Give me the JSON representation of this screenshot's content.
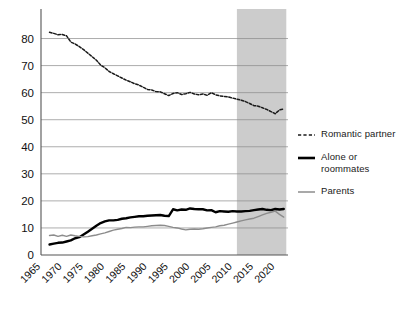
{
  "chart_data": {
    "type": "line",
    "title": "",
    "subtitle": "",
    "xlabel": "",
    "ylabel": "",
    "xlim": [
      1965,
      1922.5
    ],
    "x_range": [
      1965,
      2023
    ],
    "ylim": [
      0,
      85
    ],
    "yticks": [
      0,
      10,
      20,
      30,
      40,
      50,
      60,
      70,
      80
    ],
    "ytick_labels": [
      "0",
      "10",
      "20",
      "30",
      "40",
      "50",
      "60",
      "70",
      "80"
    ],
    "xticks": [
      1965,
      1970,
      1975,
      1980,
      1985,
      1990,
      1995,
      2000,
      2005,
      2010,
      2015,
      2020
    ],
    "xtick_labels": [
      "1965",
      "1970",
      "1975",
      "1980",
      "1985",
      "1990",
      "1995",
      "2000",
      "2005",
      "2010",
      "2015",
      "2020"
    ],
    "xtick_rotation": -45,
    "grid": "horizontal",
    "legend_position": "right",
    "shaded_region": {
      "x0": 2011,
      "x1": 2022.6,
      "color": "#cccccc",
      "label": ""
    },
    "colors": {
      "romantic_partner": "#1a1a1a",
      "alone_or_roommates": "#000000",
      "parents": "#8c8c8c"
    },
    "series": [
      {
        "name": "Romantic partner",
        "style": "dashed",
        "color": "#1a1a1a",
        "x": [
          1967,
          1968,
          1969,
          1970,
          1971,
          1972,
          1973,
          1974,
          1975,
          1976,
          1977,
          1978,
          1979,
          1980,
          1981,
          1982,
          1983,
          1984,
          1985,
          1986,
          1987,
          1988,
          1989,
          1990,
          1991,
          1992,
          1993,
          1994,
          1995,
          1996,
          1997,
          1998,
          1999,
          2000,
          2001,
          2002,
          2003,
          2004,
          2005,
          2006,
          2007,
          2008,
          2009,
          2010,
          2011,
          2012,
          2013,
          2014,
          2015,
          2016,
          2017,
          2018,
          2019,
          2020,
          2021,
          2022
        ],
        "values": [
          82.3,
          81.9,
          81.4,
          81.5,
          81.0,
          78.7,
          78.0,
          77.0,
          75.9,
          74.6,
          73.3,
          72.0,
          70.2,
          69.2,
          67.8,
          67.0,
          66.2,
          65.4,
          64.6,
          64.0,
          63.3,
          62.8,
          62.0,
          61.2,
          61.0,
          60.4,
          60.3,
          59.6,
          58.9,
          59.7,
          60.0,
          59.3,
          59.6,
          60.1,
          59.5,
          59.2,
          59.5,
          59.0,
          60.0,
          59.2,
          58.8,
          58.6,
          58.4,
          58.0,
          57.6,
          57.2,
          56.7,
          56.0,
          55.2,
          55.0,
          54.4,
          53.8,
          53.0,
          52.2,
          53.6,
          54.0
        ]
      },
      {
        "name": "Alone or roommates",
        "style": "solid-thick",
        "color": "#000000",
        "x": [
          1967,
          1968,
          1969,
          1970,
          1971,
          1972,
          1973,
          1974,
          1975,
          1976,
          1977,
          1978,
          1979,
          1980,
          1981,
          1982,
          1983,
          1984,
          1985,
          1986,
          1987,
          1988,
          1989,
          1990,
          1991,
          1992,
          1993,
          1994,
          1995,
          1996,
          1997,
          1998,
          1999,
          2000,
          2001,
          2002,
          2003,
          2004,
          2005,
          2006,
          2007,
          2008,
          2009,
          2010,
          2011,
          2012,
          2013,
          2014,
          2015,
          2016,
          2017,
          2018,
          2019,
          2020,
          2021,
          2022
        ],
        "values": [
          3.9,
          4.2,
          4.5,
          4.6,
          5.0,
          5.4,
          6.2,
          6.6,
          7.6,
          8.6,
          9.7,
          10.8,
          11.8,
          12.4,
          12.8,
          12.8,
          13.0,
          13.4,
          13.6,
          13.9,
          14.1,
          14.3,
          14.3,
          14.5,
          14.6,
          14.7,
          14.8,
          14.5,
          14.4,
          16.9,
          16.5,
          16.8,
          16.7,
          17.2,
          17.0,
          16.9,
          16.9,
          16.5,
          16.6,
          15.8,
          16.2,
          16.1,
          16.0,
          16.2,
          16.1,
          16.1,
          16.2,
          16.3,
          16.6,
          16.8,
          17.0,
          16.7,
          16.6,
          17.0,
          16.8,
          17.0
        ]
      },
      {
        "name": "Parents",
        "style": "solid-thin",
        "color": "#8c8c8c",
        "x": [
          1967,
          1968,
          1969,
          1970,
          1971,
          1972,
          1973,
          1974,
          1975,
          1976,
          1977,
          1978,
          1979,
          1980,
          1981,
          1982,
          1983,
          1984,
          1985,
          1986,
          1987,
          1988,
          1989,
          1990,
          1991,
          1992,
          1993,
          1994,
          1995,
          1996,
          1997,
          1998,
          1999,
          2000,
          2001,
          2002,
          2003,
          2004,
          2005,
          2006,
          2007,
          2008,
          2009,
          2010,
          2011,
          2012,
          2013,
          2014,
          2015,
          2016,
          2017,
          2018,
          2019,
          2020,
          2021,
          2022
        ],
        "values": [
          7.2,
          7.4,
          6.9,
          7.3,
          6.9,
          7.4,
          7.1,
          6.9,
          6.7,
          6.8,
          7.1,
          7.4,
          7.8,
          8.2,
          8.7,
          9.2,
          9.5,
          9.8,
          10.2,
          10.1,
          10.3,
          10.4,
          10.4,
          10.6,
          10.8,
          10.9,
          11.0,
          10.9,
          10.6,
          10.2,
          10.0,
          9.6,
          9.3,
          9.5,
          9.6,
          9.5,
          9.7,
          10.0,
          10.2,
          10.4,
          10.8,
          11.0,
          11.4,
          11.8,
          12.2,
          12.6,
          13.0,
          13.3,
          13.6,
          14.2,
          14.8,
          15.4,
          15.8,
          16.2,
          15.0,
          14.0
        ]
      }
    ]
  },
  "legend": {
    "items": [
      {
        "label": "Romantic partner",
        "style": "dashed"
      },
      {
        "label": "Alone or\nroommates",
        "style": "solid-thick"
      },
      {
        "label": "Parents",
        "style": "solid-thin"
      }
    ]
  }
}
